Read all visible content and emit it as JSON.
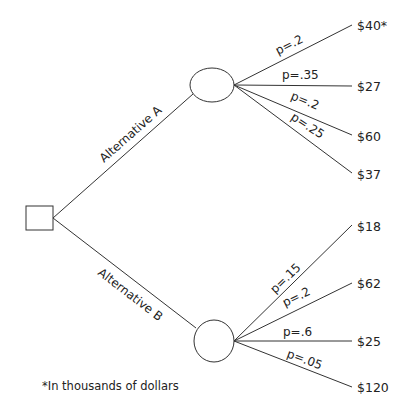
{
  "diagram": {
    "type": "decision-tree",
    "decision_node": {
      "shape": "square"
    },
    "alternatives": [
      {
        "label": "Alternative A",
        "chance_node": {
          "shape": "ellipse"
        },
        "outcomes": [
          {
            "probability": "p=.2",
            "payoff": "$40*"
          },
          {
            "probability": "p=.35",
            "payoff": "$27"
          },
          {
            "probability": "p=.2",
            "payoff": "$60"
          },
          {
            "probability": "p=.25",
            "payoff": "$37"
          }
        ]
      },
      {
        "label": "Alternative B",
        "chance_node": {
          "shape": "circle"
        },
        "outcomes": [
          {
            "probability": "p=.15",
            "payoff": "$18"
          },
          {
            "probability": "p=.2",
            "payoff": "$62"
          },
          {
            "probability": "p=.6",
            "payoff": "$25"
          },
          {
            "probability": "p=.05",
            "payoff": "$120"
          }
        ]
      }
    ],
    "footnote": "*In thousands of dollars"
  }
}
